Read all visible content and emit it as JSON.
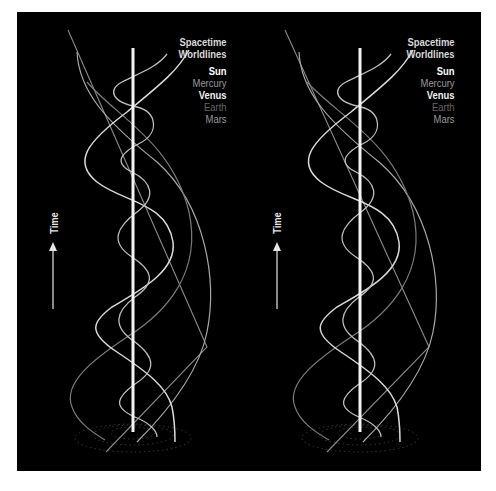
{
  "figure": {
    "background": "#000000",
    "panels": [
      {
        "id": "left",
        "legend": {
          "title_line1": "Spacetime",
          "title_line2": "Worldlines",
          "items": [
            {
              "label": "Sun",
              "color": "#ffffff"
            },
            {
              "label": "Mercury",
              "color": "#9a9a9a"
            },
            {
              "label": "Venus",
              "color": "#f2f2f2"
            },
            {
              "label": "Earth",
              "color": "#666666"
            },
            {
              "label": "Mars",
              "color": "#9a9a9a"
            }
          ]
        },
        "axis_label": "Time",
        "axis_arrow": "up-arrow"
      },
      {
        "id": "right",
        "legend": {
          "title_line1": "Spacetime",
          "title_line2": "Worldlines",
          "items": [
            {
              "label": "Sun",
              "color": "#ffffff"
            },
            {
              "label": "Mercury",
              "color": "#9a9a9a"
            },
            {
              "label": "Venus",
              "color": "#f2f2f2"
            },
            {
              "label": "Earth",
              "color": "#666666"
            },
            {
              "label": "Mars",
              "color": "#9a9a9a"
            }
          ]
        },
        "axis_label": "Time",
        "axis_arrow": "up-arrow"
      }
    ],
    "worldlines": [
      {
        "body": "Sun",
        "shape": "vertical-line",
        "color": "#f4f4f4",
        "width": 3
      },
      {
        "body": "Mercury",
        "shape": "tight-helix",
        "color": "#bdbdbd",
        "width": 1.3
      },
      {
        "body": "Venus",
        "shape": "helix",
        "color": "#d9d9d9",
        "width": 1.5
      },
      {
        "body": "Earth",
        "shape": "wide-helix",
        "color": "#7a7a7a",
        "width": 1.2
      },
      {
        "body": "Mars",
        "shape": "widest-helix",
        "color": "#a8a8a8",
        "width": 1.2
      }
    ]
  }
}
